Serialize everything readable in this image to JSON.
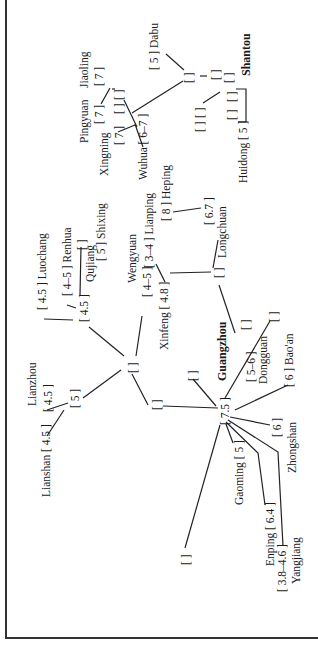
{
  "diagram": {
    "orientation": "rotated 90 degrees counter-clockwise",
    "nodes": {
      "dabu": {
        "name": "Dabu",
        "value": "[ 5 ]"
      },
      "shantou": {
        "name": "Shantou",
        "value": ""
      },
      "jiaoling": {
        "name": "Jiaoling",
        "value": "[ 7 ]"
      },
      "pingyuan": {
        "name": "Pingyuan",
        "value": "[ 7 ]"
      },
      "xingning": {
        "name": "Xingning",
        "value": "[ 7 ]"
      },
      "wuhua": {
        "name": "Wuhua",
        "value": "[ 6–7 ]"
      },
      "huidong": {
        "name": "Huidong",
        "value": "[ 5 ]"
      },
      "heping": {
        "name": "Heping",
        "value": "[ 8 ]"
      },
      "longchuan": {
        "name": "Longchuan",
        "value": "[ 6.7 ]"
      },
      "lianping": {
        "name": "Lianping",
        "value": "[ 3–4 ]"
      },
      "wengyuan": {
        "name": "Wengyuan",
        "value": "[ 4–5 ]"
      },
      "xinfeng": {
        "name": "Xinfeng",
        "value": "[ 4.8 ]"
      },
      "luochang": {
        "name": "Luochang",
        "value": "[ 4.5 ]"
      },
      "renhua": {
        "name": "Renhua",
        "value": "[ 4–5 ]"
      },
      "qujiang": {
        "name": "Qujiang",
        "value": "[ 4.5 ]"
      },
      "shixing": {
        "name": "Shixing",
        "value": "[ 5 ]"
      },
      "lianzhou": {
        "name": "Lianzhou",
        "value": "[ 4.5 ]"
      },
      "lianshan": {
        "name": "Lianshan",
        "value": "[ 4.5 ]"
      },
      "lian_junction": {
        "name": "",
        "value": "[ 5 ]"
      },
      "guangzhou": {
        "name": "Guangzhou",
        "value": "[ 7.5 ]"
      },
      "dongguan": {
        "name": "Dongguan",
        "value": "[ 5–6 ]"
      },
      "baoan": {
        "name": "Bao'an",
        "value": "[ 6 ]"
      },
      "zhongshan": {
        "name": "Zhongshan",
        "value": "[ 6 ]"
      },
      "gaoming": {
        "name": "Gaoming",
        "value": "[ 5 ]"
      },
      "enping": {
        "name": "Enping",
        "value": "[ 6.4 ]"
      },
      "yangjiang": {
        "name": "Yangjiang",
        "value": "[ 3.8–4.6 ]"
      },
      "empty": "[ ]"
    }
  }
}
